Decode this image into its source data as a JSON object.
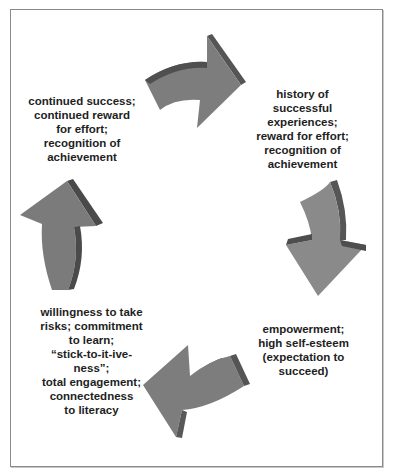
{
  "diagram": {
    "type": "cycle",
    "colors": {
      "arrow_face": "#7d7d7d",
      "arrow_side": "#5a5a5a",
      "arrow_top": "#4a4a4a",
      "border": "#8a8a8a",
      "text": "#1e1e1e"
    },
    "nodes": [
      {
        "id": "history",
        "text": "history of\nsuccessful\nexperiences;\nreward for effort;\nrecognition of\nachievement"
      },
      {
        "id": "empowerment",
        "text": "empowerment;\nhigh self-esteem\n(expectation to\nsucceed)"
      },
      {
        "id": "willingness",
        "text": "willingness to take\nrisks; commitment\nto learn;\n“stick-to-it-ive-ness”;\ntotal engagement;\nconnectedness\nto literacy"
      },
      {
        "id": "continued",
        "text": "continued success;\ncontinued reward\nfor effort;\nrecognition of\nachievement"
      }
    ],
    "arrows": [
      {
        "from": "continued",
        "to": "history",
        "direction": "right",
        "icon": "curved-arrow-right-icon"
      },
      {
        "from": "history",
        "to": "empowerment",
        "direction": "down",
        "icon": "curved-arrow-down-icon"
      },
      {
        "from": "empowerment",
        "to": "willingness",
        "direction": "left",
        "icon": "curved-arrow-left-icon"
      },
      {
        "from": "willingness",
        "to": "continued",
        "direction": "up",
        "icon": "curved-arrow-up-icon"
      }
    ]
  }
}
